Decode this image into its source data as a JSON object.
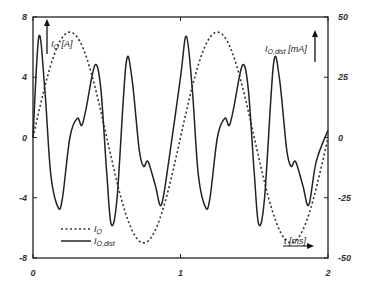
{
  "chart_data": {
    "type": "line",
    "title": "",
    "xlabel": "t [ms]",
    "ylabel_left": "I_O [A]",
    "ylabel_right": "I_O,dist [mA]",
    "xlim": [
      0,
      2
    ],
    "ylim_left": [
      -8,
      8
    ],
    "ylim_right": [
      -50,
      50
    ],
    "x_ticks": [
      "0",
      "1",
      "2"
    ],
    "y_ticks_left": [
      "8",
      "4",
      "0",
      "-4",
      "-8"
    ],
    "y_ticks_right": [
      "50",
      "25",
      "0",
      "-25",
      "-50"
    ],
    "grid": false,
    "legend_position": "lower-left",
    "series": [
      {
        "name": "I_O",
        "axis": "left",
        "style": "dashed",
        "x": [
          0,
          0.125,
          0.25,
          0.375,
          0.5,
          0.625,
          0.75,
          0.875,
          1.0,
          1.125,
          1.25,
          1.375,
          1.5,
          1.625,
          1.75,
          1.875,
          2.0
        ],
        "values": [
          0,
          4.9,
          7.0,
          4.9,
          0,
          -4.9,
          -7.0,
          -4.9,
          0,
          4.9,
          7.0,
          4.9,
          0,
          -4.9,
          -7.0,
          -4.9,
          0
        ]
      },
      {
        "name": "I_O,dist",
        "axis": "right",
        "style": "solid",
        "x": [
          0,
          0.04,
          0.08,
          0.12,
          0.17,
          0.2,
          0.25,
          0.3,
          0.33,
          0.36,
          0.42,
          0.46,
          0.5,
          0.53,
          0.57,
          0.63,
          0.67,
          0.72,
          0.75,
          0.78,
          0.83,
          0.87,
          0.92,
          1.0,
          1.04,
          1.08,
          1.12,
          1.17,
          1.2,
          1.25,
          1.3,
          1.33,
          1.36,
          1.42,
          1.46,
          1.5,
          1.53,
          1.57,
          1.63,
          1.67,
          1.72,
          1.75,
          1.78,
          1.83,
          1.87,
          1.92,
          2.0
        ],
        "values": [
          0,
          42,
          20,
          -15,
          -29,
          -25,
          0,
          8,
          5,
          12,
          30,
          20,
          -15,
          -36,
          -25,
          30,
          25,
          -5,
          -12,
          -10,
          -20,
          -28,
          -10,
          25,
          42,
          20,
          -15,
          -29,
          -25,
          0,
          8,
          5,
          12,
          30,
          20,
          -15,
          -36,
          -25,
          30,
          25,
          -5,
          -12,
          -10,
          -20,
          -28,
          -10,
          3
        ]
      }
    ],
    "legend": [
      "I_O",
      "I_O,dist"
    ]
  },
  "labels": {
    "left_axis": "I",
    "left_axis_sub": "O",
    "left_axis_unit": " [A]",
    "right_axis": "I",
    "right_axis_sub": "O,dist",
    "right_axis_unit": " [mA]",
    "x_axis": "t [ms]",
    "legend_1": "I",
    "legend_1_sub": "O",
    "legend_2": "I",
    "legend_2_sub": "O,dist"
  }
}
